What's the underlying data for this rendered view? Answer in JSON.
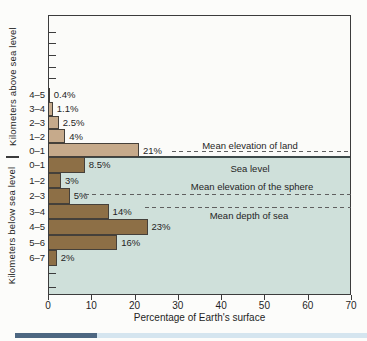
{
  "chart_data": {
    "type": "bar",
    "orientation": "horizontal",
    "title": "",
    "xlabel": "Percentage of Earth's surface",
    "xlim": [
      0,
      70
    ],
    "x_ticks": [
      0,
      10,
      20,
      30,
      40,
      50,
      60,
      70
    ],
    "grid": false,
    "above_sea": {
      "axis_label": "Kilometers above sea level",
      "categories": [
        "4–5",
        "3–4",
        "2–3",
        "1–2",
        "0–1"
      ],
      "values": [
        0.4,
        1.1,
        2.5,
        4,
        21
      ],
      "value_labels": [
        "0.4%",
        "1.1%",
        "2.5%",
        "4%",
        "21%"
      ]
    },
    "below_sea": {
      "axis_label": "Kilometers below sea level",
      "categories": [
        "0–1",
        "1–2",
        "2–3",
        "3–4",
        "4–5",
        "5–6",
        "6–7"
      ],
      "values": [
        8.5,
        3,
        5,
        14,
        23,
        16,
        2
      ],
      "value_labels": [
        "8.5%",
        "3%",
        "5%",
        "14%",
        "23%",
        "16%",
        "2%"
      ]
    },
    "annotations": [
      {
        "label": "Mean elevation of land"
      },
      {
        "label": "Sea level"
      },
      {
        "label": "Mean elevation of the sphere"
      },
      {
        "label": "Mean depth of sea"
      }
    ]
  },
  "colors": {
    "above_bar": "#c6aa8b",
    "below_bar": "#8d6f46",
    "bar_outline": "#45403a",
    "sea_background": "#cfe0da",
    "sea_line": "#3d4a4a",
    "axis": "#3c3c3c",
    "dash": "#5f5f5f",
    "text": "#1f1f1f",
    "band_dark": "#4d6781",
    "band_light": "#d5e5ef"
  }
}
